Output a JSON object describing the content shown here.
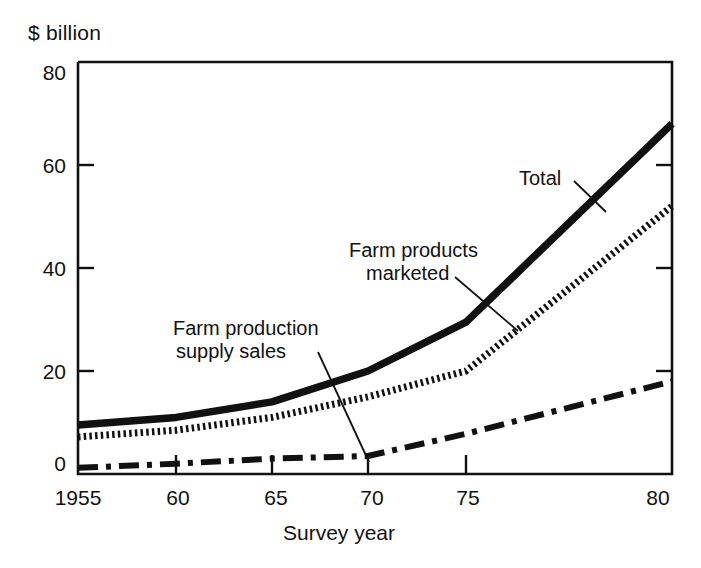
{
  "chart_data": {
    "type": "line",
    "title": "",
    "xlabel": "Survey year",
    "ylabel": "$ billion",
    "xlim": [
      1955,
      1980
    ],
    "ylim": [
      0,
      80
    ],
    "grid": false,
    "legend_position": "inline-annotations",
    "x": [
      1955,
      1960,
      1965,
      1970,
      1975,
      1980
    ],
    "xtick_labels": [
      "1955",
      "60",
      "65",
      "70",
      "75",
      "80"
    ],
    "ytick_labels": [
      "0",
      "20",
      "40",
      "60",
      "80"
    ],
    "ytick_values": [
      0,
      20,
      40,
      60,
      80
    ],
    "series": [
      {
        "name": "Total",
        "style": "solid-thick",
        "values": [
          9.5,
          11.0,
          14.0,
          20.0,
          29.5,
          68.0
        ]
      },
      {
        "name": "Farm products marketed",
        "style": "dotted-thick",
        "values": [
          7.2,
          8.5,
          11.0,
          15.0,
          20.0,
          52.0
        ]
      },
      {
        "name": "Farm production supply sales",
        "style": "dash-dot",
        "values": [
          1.2,
          2.0,
          3.0,
          3.5,
          7.8,
          18.0
        ]
      }
    ],
    "annotations": [
      {
        "text": "Total",
        "series": "Total"
      },
      {
        "text": "Farm products",
        "series": "Farm products marketed"
      },
      {
        "text": "marketed",
        "series": "Farm products marketed"
      },
      {
        "text": "Farm production",
        "series": "Farm production supply sales"
      },
      {
        "text": "supply sales",
        "series": "Farm production supply sales"
      }
    ],
    "colors": {
      "ink": "#111111",
      "background": "#ffffff"
    }
  },
  "axes": {
    "y_unit_label": "$ billion",
    "x_axis_title": "Survey year",
    "y_ticks": [
      {
        "label": "80",
        "value": 80
      },
      {
        "label": "60",
        "value": 60
      },
      {
        "label": "40",
        "value": 40
      },
      {
        "label": "20",
        "value": 20
      },
      {
        "label": "0",
        "value": 0
      }
    ],
    "x_ticks": [
      {
        "label": "1955",
        "value": 1955
      },
      {
        "label": "60",
        "value": 1960
      },
      {
        "label": "65",
        "value": 1965
      },
      {
        "label": "70",
        "value": 1970
      },
      {
        "label": "75",
        "value": 1975
      },
      {
        "label": "80",
        "value": 1980
      }
    ]
  },
  "labels": {
    "total": "Total",
    "farm_products_line1": "Farm products",
    "farm_products_line2": "marketed",
    "farm_supply_line1": "Farm production",
    "farm_supply_line2": "supply sales"
  }
}
